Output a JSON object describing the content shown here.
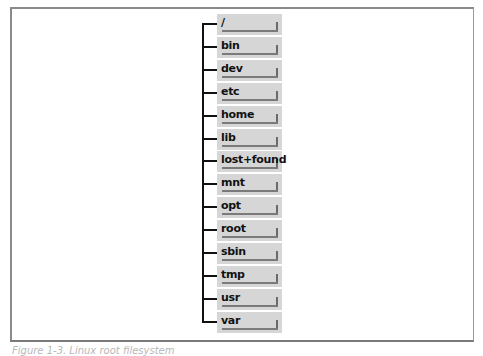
{
  "diagram": {
    "title_caption": "Figure 1-3. Linux root filesystem",
    "root": "/",
    "directories": [
      "/",
      "bin",
      "dev",
      "etc",
      "home",
      "lib",
      "lost+found",
      "mnt",
      "opt",
      "root",
      "sbin",
      "tmp",
      "usr",
      "var"
    ],
    "colors": {
      "box_fill": "#d6d6d6",
      "box_shadow": "#6a6a6a",
      "connector": "#111111",
      "frame": "#8a8a8a"
    }
  }
}
